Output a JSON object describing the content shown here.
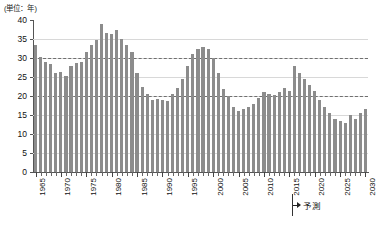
{
  "chart_data": {
    "type": "bar",
    "title": "",
    "subtitle": "",
    "unit_caption": "(単位：年)",
    "xlabel": "",
    "ylabel": "",
    "ylim": [
      0,
      40
    ],
    "ytick_step": 5,
    "yticks": [
      "0",
      "5",
      "10",
      "15",
      "20",
      "25",
      "30",
      "35",
      "40"
    ],
    "grid": true,
    "gridlines_solid": [
      5,
      10,
      15,
      20,
      25,
      30,
      35
    ],
    "reference_lines": [
      20,
      30
    ],
    "legend": [],
    "legend_position": "none",
    "bar_color": "#8c8c8c",
    "axis_color": "#555555",
    "gridline_color": "#d8d8d8",
    "refline_color": "#6f6f6f",
    "xtick_labels": [
      "1965",
      "1970",
      "1975",
      "1980",
      "1985",
      "1990",
      "1995",
      "2000",
      "2005",
      "2010",
      "2015",
      "2020",
      "2025",
      "2030"
    ],
    "xtick_label_years": [
      1965,
      1970,
      1975,
      1980,
      1985,
      1990,
      1995,
      2000,
      2005,
      2010,
      2015,
      2020,
      2025,
      2030
    ],
    "annotations": [
      {
        "name": "forecast-marker",
        "label": "予測",
        "start_year": 2016,
        "arrow": "right"
      }
    ],
    "categories": [
      1965,
      1966,
      1967,
      1968,
      1969,
      1970,
      1971,
      1972,
      1973,
      1974,
      1975,
      1976,
      1977,
      1978,
      1979,
      1980,
      1981,
      1982,
      1983,
      1984,
      1985,
      1986,
      1987,
      1988,
      1989,
      1990,
      1991,
      1992,
      1993,
      1994,
      1995,
      1996,
      1997,
      1998,
      1999,
      2000,
      2001,
      2002,
      2003,
      2004,
      2005,
      2006,
      2007,
      2008,
      2009,
      2010,
      2011,
      2012,
      2013,
      2014,
      2015,
      2016,
      2017,
      2018,
      2019,
      2020,
      2021,
      2022,
      2023,
      2024,
      2025,
      2026,
      2027,
      2028,
      2029,
      2030
    ],
    "values": [
      33.5,
      30.3,
      29.0,
      28.5,
      26.0,
      26.3,
      25.3,
      28.0,
      28.8,
      29.0,
      31.5,
      33.3,
      34.8,
      39.0,
      36.5,
      36.2,
      37.3,
      35.0,
      33.5,
      31.5,
      26.0,
      22.5,
      20.5,
      19.0,
      19.2,
      19.0,
      18.8,
      20.5,
      22.0,
      24.5,
      28.0,
      31.0,
      32.3,
      33.0,
      32.5,
      30.0,
      26.0,
      21.8,
      20.0,
      17.0,
      16.0,
      16.5,
      17.0,
      18.0,
      19.5,
      21.0,
      20.5,
      20.3,
      21.0,
      22.0,
      21.3,
      28.0,
      26.0,
      24.5,
      23.0,
      21.3,
      19.0,
      17.0,
      15.5,
      14.0,
      13.5,
      13.0,
      15.0,
      14.0,
      15.5,
      16.5
    ]
  }
}
